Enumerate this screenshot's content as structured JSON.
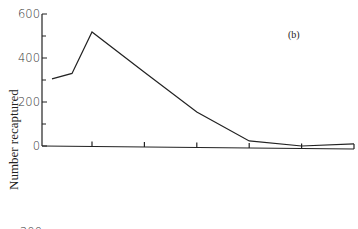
{
  "chart_data": {
    "type": "line",
    "title": "",
    "panel_label": "(b)",
    "xlabel": "",
    "ylabel": "Number recaptured",
    "ylim": [
      0,
      600
    ],
    "yticks": [
      0,
      200,
      400,
      600
    ],
    "yticks_minor": [
      100,
      300,
      500
    ],
    "x_tick_count": 6,
    "series": [
      {
        "name": "recaptured",
        "x": [
          0,
          0.4,
          0.8,
          1.8,
          2.8,
          3.8,
          4.8,
          5.8
        ],
        "values": [
          305,
          330,
          518,
          335,
          155,
          23,
          0,
          10
        ]
      }
    ],
    "partial_next_panel_tick": "200"
  }
}
